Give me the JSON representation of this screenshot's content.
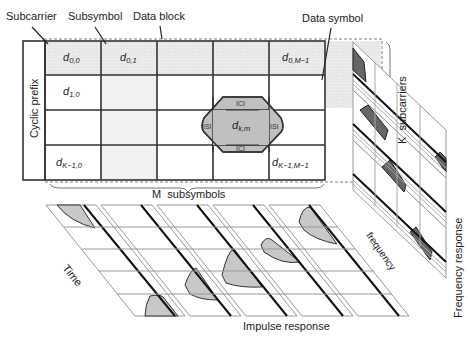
{
  "labels": {
    "subcarrier": "Subcarrier",
    "subsymbol": "Subsymbol",
    "data_block": "Data block",
    "data_symbol": "Data symbol",
    "cyclic_prefix": "Cyclic prefix",
    "k_subcarriers": "K  subcarriers",
    "m_subsymbols": "M  subsymbols",
    "time": "Time",
    "impulse_response": "Impulse response",
    "frequency": "frequency",
    "frequency_response": "Frequency response"
  },
  "grid": {
    "rows": 4,
    "cols": 5,
    "cells": {
      "d00": {
        "base": "d",
        "sub": "0,0"
      },
      "d01": {
        "base": "d",
        "sub": "0,1"
      },
      "d0M": {
        "base": "d",
        "sub": "0,M−1"
      },
      "d10": {
        "base": "d",
        "sub": "1,0"
      },
      "dkm": {
        "base": "d",
        "sub": "k,m"
      },
      "dK0": {
        "base": "d",
        "sub": "K−1,0"
      },
      "dKM": {
        "base": "d",
        "sub": "K−1,M−1"
      }
    }
  },
  "interference": {
    "ici_top": "ICI",
    "ici_bottom": "ICI",
    "isi_left": "ISI",
    "isi_right": "ISI"
  },
  "colors": {
    "grid_line": "#333333",
    "shaded": "#e6e6e6",
    "diamond": "#bfbfbf",
    "impulse_fill": "#c8c8c8",
    "freq_fill": "#666666"
  }
}
